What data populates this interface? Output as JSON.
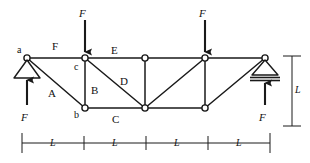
{
  "figure": {
    "type": "truss-free-body-diagram",
    "stroke_color": "#1a1a1a",
    "node_fill": "#ffffff",
    "background": "#ffffff"
  },
  "geometry": {
    "top_chord_y": 58,
    "bottom_chord_y": 108,
    "panel_width": 60,
    "top_nodes_x": [
      27,
      85,
      145,
      205,
      265
    ],
    "bottom_nodes_x": [
      85,
      145,
      205
    ]
  },
  "node_labels": [
    {
      "id": "node-a",
      "text": "a",
      "x": 17,
      "y": 45
    },
    {
      "id": "node-c",
      "text": "c",
      "x": 74,
      "y": 62
    },
    {
      "id": "node-b",
      "text": "b",
      "x": 74,
      "y": 110
    }
  ],
  "member_labels": [
    {
      "id": "member-F",
      "text": "F",
      "x": 52,
      "y": 41
    },
    {
      "id": "member-E",
      "text": "E",
      "x": 111,
      "y": 45
    },
    {
      "id": "member-A",
      "text": "A",
      "x": 48,
      "y": 88
    },
    {
      "id": "member-B",
      "text": "B",
      "x": 91,
      "y": 85
    },
    {
      "id": "member-D",
      "text": "D",
      "x": 120,
      "y": 76
    },
    {
      "id": "member-C",
      "text": "C",
      "x": 112,
      "y": 114
    }
  ],
  "applied_loads": [
    {
      "id": "load-c",
      "label": "F",
      "x": 85,
      "direction": "down",
      "label_x": 79,
      "label_y": 8
    },
    {
      "id": "load-right",
      "label": "F",
      "x": 205,
      "direction": "down",
      "label_x": 199,
      "label_y": 8
    }
  ],
  "reactions": [
    {
      "id": "reaction-left",
      "label": "F",
      "x": 27,
      "direction": "up",
      "label_x": 21,
      "label_y": 112
    },
    {
      "id": "reaction-right",
      "label": "F",
      "x": 265,
      "direction": "up",
      "label_x": 259,
      "label_y": 112
    }
  ],
  "supports": [
    {
      "id": "support-left",
      "type": "pin",
      "x": 27,
      "y": 58
    },
    {
      "id": "support-right",
      "type": "roller",
      "x": 265,
      "y": 58
    }
  ],
  "dimensions": {
    "horizontal": {
      "id": "horizontal-dimension-line",
      "y": 143,
      "x_start": 22,
      "x_end": 270,
      "ticks": [
        22,
        84,
        146,
        208,
        270
      ],
      "segments": [
        {
          "label": "L",
          "center_x": 53
        },
        {
          "label": "L",
          "center_x": 115
        },
        {
          "label": "L",
          "center_x": 177
        },
        {
          "label": "L",
          "center_x": 239
        }
      ]
    },
    "vertical": {
      "id": "vertical-dimension-line",
      "x": 292,
      "y_start": 56,
      "y_end": 126,
      "label": "L",
      "label_x": 295,
      "label_y": 85
    }
  }
}
